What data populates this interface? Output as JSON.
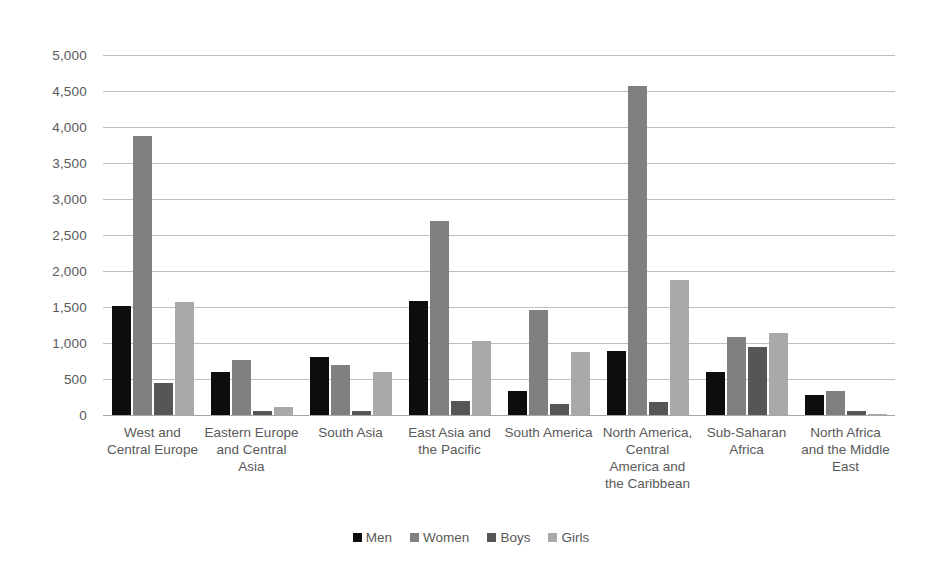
{
  "chart_data": {
    "type": "bar",
    "title": "",
    "subtitle": "",
    "xlabel": "",
    "ylabel": "",
    "ylim": [
      0,
      5000
    ],
    "ytick_step": 500,
    "ytick_labels": [
      "5,000",
      "4,500",
      "4,000",
      "3,500",
      "3,000",
      "2,500",
      "2,000",
      "1,500",
      "1,000",
      "500",
      "0"
    ],
    "ytick_values": [
      5000,
      4500,
      4000,
      3500,
      3000,
      2500,
      2000,
      1500,
      1000,
      500,
      0
    ],
    "grid": true,
    "legend_position": "bottom",
    "categories": [
      "West and Central Europe",
      "Eastern Europe and Central Asia",
      "South Asia",
      "East Asia and the Pacific",
      "South America",
      "North America, Central America and the Caribbean",
      "Sub-Saharan Africa",
      "North Africa and the Middle East"
    ],
    "series": [
      {
        "name": "Men",
        "color": "#0d0d0d",
        "values": [
          1520,
          600,
          800,
          1590,
          330,
          895,
          600,
          275
        ]
      },
      {
        "name": "Women",
        "color": "#808080",
        "values": [
          3880,
          760,
          690,
          2700,
          1460,
          4565,
          1090,
          340
        ]
      },
      {
        "name": "Boys",
        "color": "#565656",
        "values": [
          440,
          50,
          60,
          195,
          150,
          185,
          950,
          50
        ]
      },
      {
        "name": "Girls",
        "color": "#a9a9a9",
        "values": [
          1570,
          110,
          595,
          1030,
          870,
          1870,
          1135,
          10
        ]
      }
    ]
  },
  "legend": {
    "items": [
      {
        "label": "Men",
        "key": "men"
      },
      {
        "label": "Women",
        "key": "women"
      },
      {
        "label": "Boys",
        "key": "boys"
      },
      {
        "label": "Girls",
        "key": "girls"
      }
    ]
  },
  "colors": {
    "men": "#0d0d0d",
    "women": "#808080",
    "boys": "#565656",
    "girls": "#a9a9a9",
    "gridline": "#bfbfbf",
    "text": "#595959",
    "background": "#ffffff"
  }
}
